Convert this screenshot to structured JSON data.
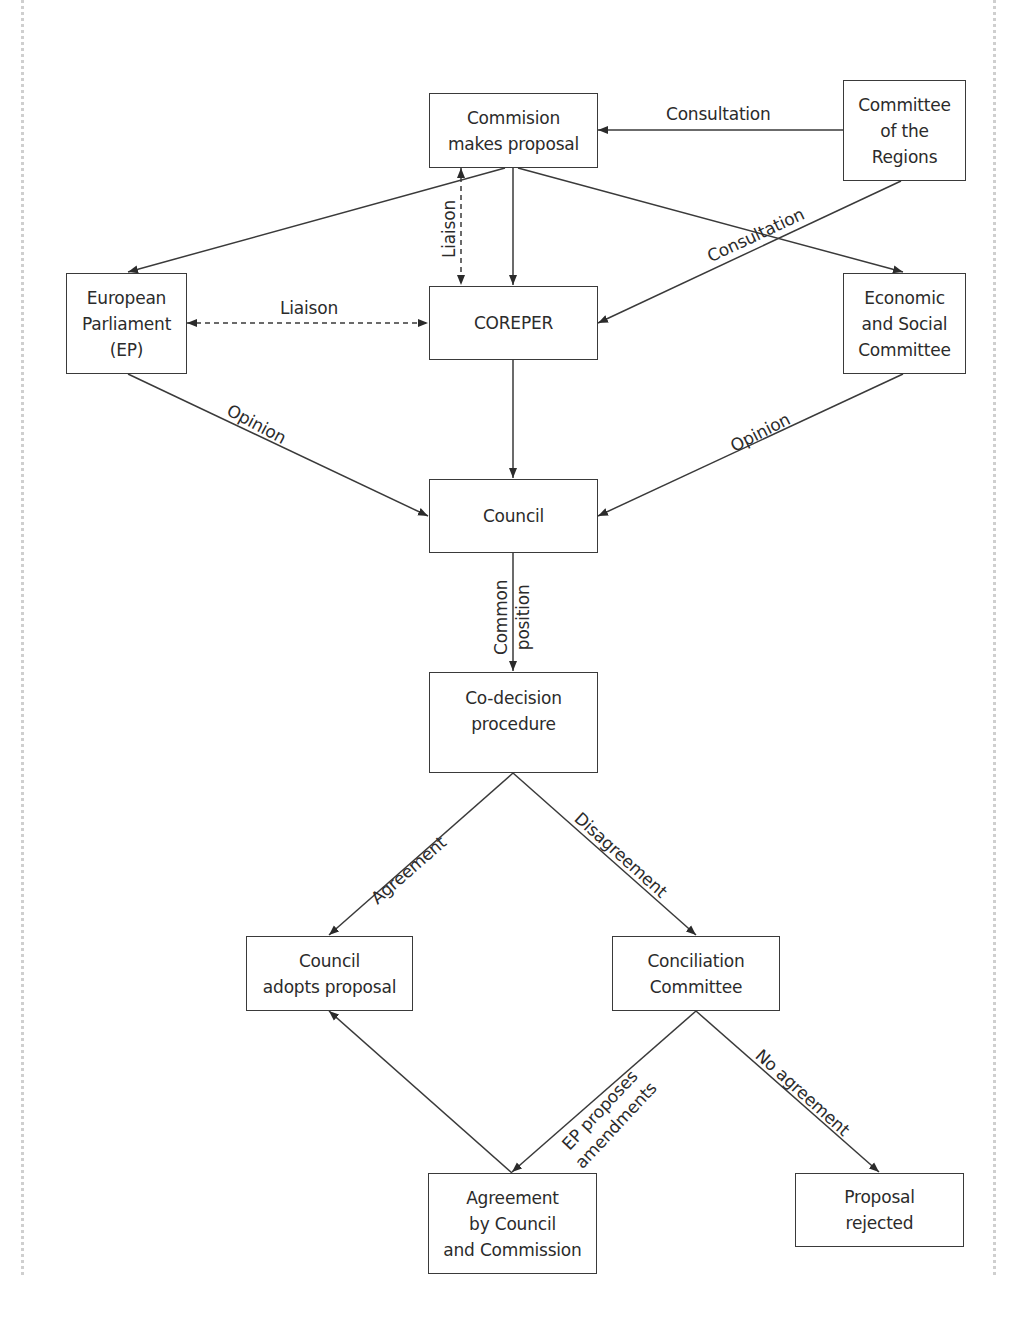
{
  "diagram": {
    "nodes": [
      {
        "id": "commission",
        "lines": [
          "Commision",
          "makes proposal"
        ],
        "x": 429,
        "y": 93,
        "w": 169,
        "h": 75
      },
      {
        "id": "committee-regions",
        "lines": [
          "Committee",
          "of the",
          "Regions"
        ],
        "x": 843,
        "y": 80,
        "w": 123,
        "h": 101
      },
      {
        "id": "european-parliament",
        "lines": [
          "European",
          "Parliament",
          "(EP)"
        ],
        "x": 66,
        "y": 273,
        "w": 121,
        "h": 101
      },
      {
        "id": "coreper",
        "lines": [
          "COREPER"
        ],
        "x": 429,
        "y": 286,
        "w": 169,
        "h": 74
      },
      {
        "id": "economic-social-committee",
        "lines": [
          "Economic",
          "and Social",
          "Committee"
        ],
        "x": 843,
        "y": 273,
        "w": 123,
        "h": 101
      },
      {
        "id": "council",
        "lines": [
          "Council"
        ],
        "x": 429,
        "y": 479,
        "w": 169,
        "h": 74
      },
      {
        "id": "co-decision",
        "lines": [
          "Co-decision",
          "procedure"
        ],
        "x": 429,
        "y": 672,
        "w": 169,
        "h": 101,
        "align": "top"
      },
      {
        "id": "council-adopts",
        "lines": [
          "Council",
          "adopts proposal"
        ],
        "x": 246,
        "y": 936,
        "w": 167,
        "h": 75
      },
      {
        "id": "conciliation",
        "lines": [
          "Conciliation",
          "Committee"
        ],
        "x": 612,
        "y": 936,
        "w": 168,
        "h": 75
      },
      {
        "id": "agreement-council-commission",
        "lines": [
          "Agreement",
          "by Council",
          "and Commission"
        ],
        "x": 428,
        "y": 1173,
        "w": 169,
        "h": 101
      },
      {
        "id": "proposal-rejected",
        "lines": [
          "Proposal",
          "rejected"
        ],
        "x": 795,
        "y": 1173,
        "w": 169,
        "h": 74
      }
    ],
    "edges": [
      {
        "id": "regions-to-commission",
        "from": "committee-regions",
        "to": "commission",
        "points": [
          [
            843,
            130
          ],
          [
            598,
            130
          ]
        ],
        "style": "solid",
        "arrow_end": true,
        "arrow_start": false,
        "label": "Consultation",
        "label_x": 666,
        "label_y": 104,
        "label_rot": 0
      },
      {
        "id": "commission-to-ep",
        "from": "commission",
        "to": "european-parliament",
        "points": [
          [
            505,
            168
          ],
          [
            128,
            272
          ]
        ],
        "style": "solid",
        "arrow_end": true,
        "arrow_start": false,
        "label": "",
        "label_x": 0,
        "label_y": 0,
        "label_rot": 0
      },
      {
        "id": "commission-coreper-liaison",
        "from": "commission",
        "to": "coreper",
        "points": [
          [
            461,
            168
          ],
          [
            461,
            285
          ]
        ],
        "style": "dashed",
        "arrow_end": true,
        "arrow_start": true,
        "label": "Liaison",
        "label_x": 439,
        "label_y": 258,
        "label_rot": -90
      },
      {
        "id": "commission-to-coreper",
        "from": "commission",
        "to": "coreper",
        "points": [
          [
            513,
            168
          ],
          [
            513,
            285
          ]
        ],
        "style": "solid",
        "arrow_end": true,
        "arrow_start": false,
        "label": "",
        "label_x": 0,
        "label_y": 0,
        "label_rot": 0
      },
      {
        "id": "commission-to-esc",
        "from": "commission",
        "to": "economic-social-committee",
        "points": [
          [
            518,
            168
          ],
          [
            903,
            272
          ]
        ],
        "style": "solid",
        "arrow_end": true,
        "arrow_start": false,
        "label": "",
        "label_x": 0,
        "label_y": 0,
        "label_rot": 0
      },
      {
        "id": "regions-to-coreper",
        "from": "committee-regions",
        "to": "coreper",
        "points": [
          [
            901,
            181
          ],
          [
            598,
            323
          ]
        ],
        "style": "solid",
        "arrow_end": true,
        "arrow_start": false,
        "label": "Consultation",
        "label_x": 704,
        "label_y": 248,
        "label_rot": -25
      },
      {
        "id": "ep-coreper-liaison",
        "from": "european-parliament",
        "to": "coreper",
        "points": [
          [
            187,
            323
          ],
          [
            428,
            323
          ]
        ],
        "style": "dashed",
        "arrow_end": true,
        "arrow_start": true,
        "label": "Liaison",
        "label_x": 280,
        "label_y": 298,
        "label_rot": 0
      },
      {
        "id": "ep-to-council",
        "from": "european-parliament",
        "to": "council",
        "points": [
          [
            128,
            374
          ],
          [
            428,
            516
          ]
        ],
        "style": "solid",
        "arrow_end": true,
        "arrow_start": false,
        "label": "Opinion",
        "label_x": 233,
        "label_y": 400,
        "label_rot": 28
      },
      {
        "id": "coreper-to-council",
        "from": "coreper",
        "to": "council",
        "points": [
          [
            513,
            360
          ],
          [
            513,
            478
          ]
        ],
        "style": "solid",
        "arrow_end": true,
        "arrow_start": false,
        "label": "",
        "label_x": 0,
        "label_y": 0,
        "label_rot": 0
      },
      {
        "id": "esc-to-council",
        "from": "economic-social-committee",
        "to": "council",
        "points": [
          [
            903,
            374
          ],
          [
            598,
            516
          ]
        ],
        "style": "solid",
        "arrow_end": true,
        "arrow_start": false,
        "label": "Opinion",
        "label_x": 727,
        "label_y": 438,
        "label_rot": -27
      },
      {
        "id": "council-to-codecision",
        "from": "council",
        "to": "co-decision",
        "points": [
          [
            513,
            553
          ],
          [
            513,
            671
          ]
        ],
        "style": "solid",
        "arrow_end": true,
        "arrow_start": false,
        "label": "",
        "label_x": 0,
        "label_y": 0,
        "label_rot": 0
      },
      {
        "id": "codecision-to-council-adopts",
        "from": "co-decision",
        "to": "council-adopts",
        "points": [
          [
            513,
            773
          ],
          [
            329,
            935
          ]
        ],
        "style": "solid",
        "arrow_end": true,
        "arrow_start": false,
        "label": "Agreement",
        "label_x": 367,
        "label_y": 893,
        "label_rot": -41
      },
      {
        "id": "codecision-to-conciliation",
        "from": "co-decision",
        "to": "conciliation",
        "points": [
          [
            513,
            773
          ],
          [
            696,
            935
          ]
        ],
        "style": "solid",
        "arrow_end": true,
        "arrow_start": false,
        "label": "Disagreement",
        "label_x": 584,
        "label_y": 808,
        "label_rot": 42
      },
      {
        "id": "conciliation-to-agreement",
        "from": "conciliation",
        "to": "agreement-council-commission",
        "points": [
          [
            696,
            1011
          ],
          [
            512,
            1172
          ]
        ],
        "style": "solid",
        "arrow_end": true,
        "arrow_start": false,
        "label": "",
        "label_x": 0,
        "label_y": 0,
        "label_rot": 0
      },
      {
        "id": "agreement-to-council-adopts",
        "from": "agreement-council-commission",
        "to": "council-adopts",
        "points": [
          [
            512,
            1173
          ],
          [
            329,
            1011
          ]
        ],
        "style": "solid",
        "arrow_end": true,
        "arrow_start": false,
        "label": "",
        "label_x": 0,
        "label_y": 0,
        "label_rot": 0
      },
      {
        "id": "conciliation-to-rejected",
        "from": "conciliation",
        "to": "proposal-rejected",
        "points": [
          [
            696,
            1011
          ],
          [
            879,
            1172
          ]
        ],
        "style": "solid",
        "arrow_end": true,
        "arrow_start": false,
        "label": "No agreement",
        "label_x": 765,
        "label_y": 1045,
        "label_rot": 42
      }
    ],
    "extra_labels": {
      "common_position": {
        "lines": [
          "Common",
          "position"
        ],
        "rot": -90
      },
      "ep_amendments": {
        "lines": [
          "EP proposes",
          "amendments"
        ],
        "rot": -42
      }
    },
    "colors": {
      "ink": "#2b2b2b",
      "line": "#3a3a3a",
      "page_border": "#cfcfcf",
      "background": "#ffffff"
    }
  }
}
